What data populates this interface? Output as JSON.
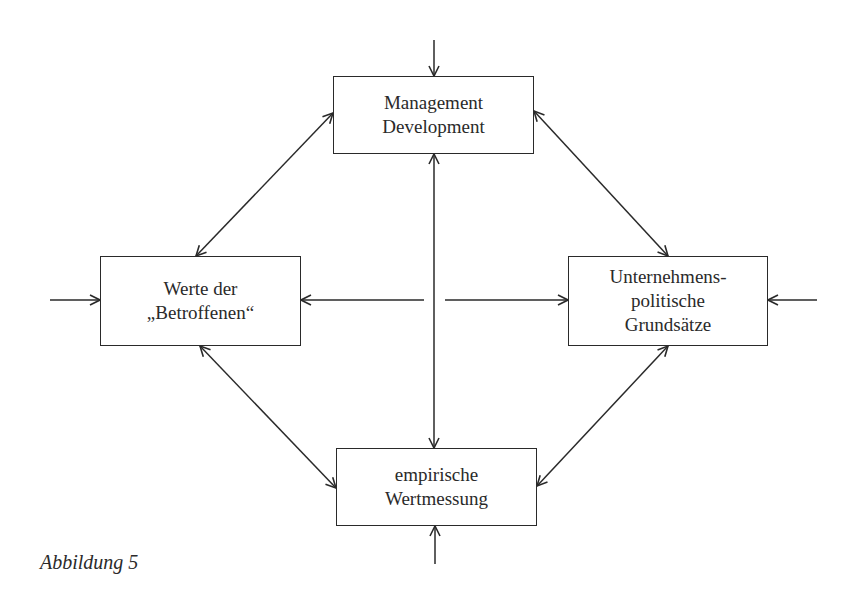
{
  "diagram": {
    "nodes": {
      "top": {
        "lines": [
          "Management",
          "Development"
        ]
      },
      "left": {
        "lines": [
          "Werte der",
          "„Betroffenen“"
        ]
      },
      "right": {
        "lines": [
          "Unternehmens-",
          "politische",
          "Grundsätze"
        ]
      },
      "bottom": {
        "lines": [
          "empirische",
          "Wertmessung"
        ]
      }
    },
    "edges": [
      {
        "from": "top",
        "to": "left",
        "type": "bidirectional"
      },
      {
        "from": "top",
        "to": "right",
        "type": "bidirectional"
      },
      {
        "from": "left",
        "to": "bottom",
        "type": "bidirectional"
      },
      {
        "from": "right",
        "to": "bottom",
        "type": "bidirectional"
      },
      {
        "from": "top",
        "to": "bottom",
        "type": "bidirectional"
      },
      {
        "from": "center",
        "to": "left",
        "type": "directed"
      },
      {
        "from": "center",
        "to": "right",
        "type": "directed"
      },
      {
        "from": "external-top",
        "to": "top",
        "type": "directed"
      },
      {
        "from": "external-left",
        "to": "left",
        "type": "directed"
      },
      {
        "from": "external-right",
        "to": "right",
        "type": "directed"
      },
      {
        "from": "external-bottom",
        "to": "bottom",
        "type": "directed"
      }
    ],
    "line_color": "#2a2a2a"
  },
  "caption": "Abbildung 5"
}
